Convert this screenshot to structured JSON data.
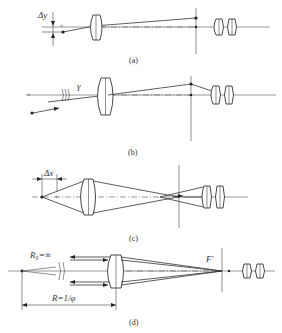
{
  "figure": {
    "panels": [
      {
        "id": "a",
        "caption": "(a)",
        "labels": {
          "delta": "Δy"
        }
      },
      {
        "id": "b",
        "caption": "(b)",
        "labels": {
          "angle": "γ"
        }
      },
      {
        "id": "c",
        "caption": "(c)",
        "labels": {
          "delta": "Δx"
        }
      },
      {
        "id": "d",
        "caption": "(d)",
        "labels": {
          "radius0": "R₀=∞",
          "radius": "R=1/φ",
          "focus": "F′"
        }
      }
    ]
  }
}
